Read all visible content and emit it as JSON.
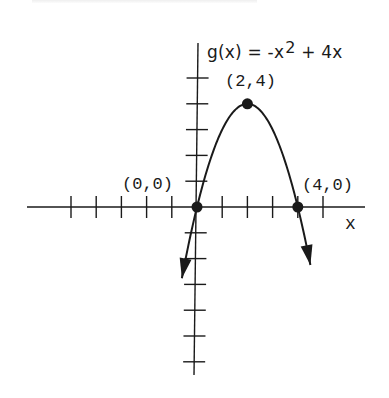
{
  "chart_data": {
    "type": "line",
    "function": {
      "name": "g(x)",
      "prefix": "g(x) = ",
      "term1_base": "-x",
      "term1_exp": "2",
      "term2": " + 4x"
    },
    "xlabel": "x",
    "ylabel": "",
    "xlim": [
      -5,
      6
    ],
    "ylim": [
      -6,
      6
    ],
    "grid": false,
    "x_ticks_step": 1,
    "y_ticks_step": 1,
    "curve": {
      "x": [
        -0.6,
        0,
        0.5,
        1,
        1.5,
        2,
        2.5,
        3,
        3.5,
        4,
        4.5
      ],
      "y": [
        -2.76,
        0,
        1.75,
        3,
        3.75,
        4,
        3.75,
        3,
        1.75,
        0,
        -2.25
      ],
      "arrows_at_ends": true
    },
    "points": [
      {
        "label": "(2,4)",
        "x": 2,
        "y": 4
      },
      {
        "label": "(0,0)",
        "x": 0,
        "y": 0
      },
      {
        "label": "(4,0)",
        "x": 4,
        "y": 0
      }
    ]
  },
  "labels": {
    "vertex": "(2,4)",
    "origin": "(0,0)",
    "root": "(4,0)",
    "x_axis": "x"
  },
  "style": {
    "ink_color": "#1a1a1a",
    "background": "#ffffff"
  }
}
